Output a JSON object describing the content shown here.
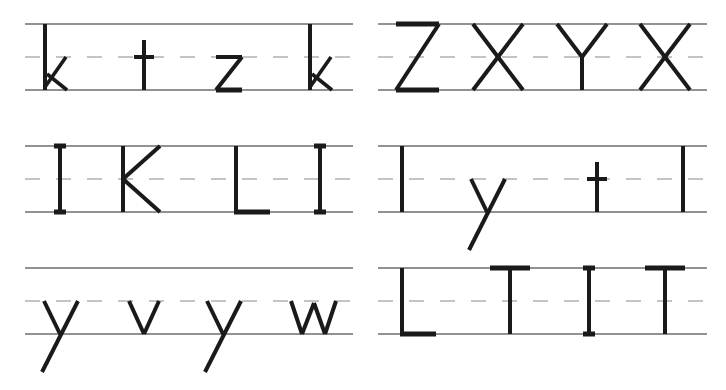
{
  "worksheet": {
    "type": "handwriting-practice",
    "colors": {
      "ink": "#1a1a1a",
      "solid_line": "#6e6e6e",
      "dashed_line": "#8a8a8a",
      "background": "#ffffff"
    },
    "panels": [
      {
        "id": "r1-left",
        "row": 1,
        "col": "left",
        "letters": [
          "k",
          "t",
          "z",
          "k"
        ]
      },
      {
        "id": "r1-right",
        "row": 1,
        "col": "right",
        "letters": [
          "Z",
          "X",
          "Y",
          "X"
        ]
      },
      {
        "id": "r2-left",
        "row": 2,
        "col": "left",
        "letters": [
          "I",
          "K",
          "L",
          "I"
        ]
      },
      {
        "id": "r2-right",
        "row": 2,
        "col": "right",
        "letters": [
          "l",
          "y",
          "t",
          "l"
        ]
      },
      {
        "id": "r3-left",
        "row": 3,
        "col": "left",
        "letters": [
          "y",
          "v",
          "y",
          "w"
        ]
      },
      {
        "id": "r3-right",
        "row": 3,
        "col": "right",
        "letters": [
          "L",
          "T",
          "I",
          "T"
        ]
      }
    ]
  }
}
